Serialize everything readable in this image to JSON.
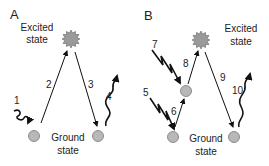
{
  "panels": [
    {
      "id": "A",
      "label": "A",
      "excited_label": [
        "Excited",
        "state"
      ],
      "ground_label": [
        "Ground",
        "state"
      ],
      "steps": [
        {
          "n": "1",
          "type": "wavy-in"
        },
        {
          "n": "2",
          "type": "excitation"
        },
        {
          "n": "3",
          "type": "relaxation"
        },
        {
          "n": "4",
          "type": "wavy-out"
        }
      ]
    },
    {
      "id": "B",
      "label": "B",
      "excited_label": [
        "Excited",
        "state"
      ],
      "ground_label": [
        "Ground",
        "state"
      ],
      "steps": [
        {
          "n": "5",
          "type": "zigzag-in"
        },
        {
          "n": "6",
          "type": "excitation"
        },
        {
          "n": "7",
          "type": "zigzag-in"
        },
        {
          "n": "8",
          "type": "excitation"
        },
        {
          "n": "9",
          "type": "relaxation"
        },
        {
          "n": "10",
          "type": "wavy-out"
        }
      ]
    }
  ],
  "colors": {
    "line": "#111111",
    "node_fill": "#b8b8b8",
    "node_stroke": "#777777",
    "star_fill": "#9a9a9a"
  }
}
